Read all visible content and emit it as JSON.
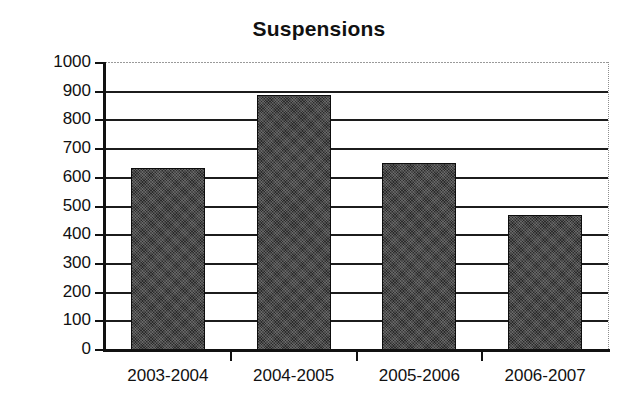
{
  "chart_data": {
    "type": "bar",
    "title": "Suspensions",
    "xlabel": "",
    "ylabel": "",
    "categories": [
      "2003-2004",
      "2004-2005",
      "2005-2006",
      "2006-2007"
    ],
    "values": [
      635,
      890,
      650,
      470
    ],
    "ylim": [
      0,
      1000
    ],
    "ytick_labels": [
      "1000",
      "900",
      "800",
      "700",
      "600",
      "500",
      "400",
      "300",
      "200",
      "100",
      "0"
    ],
    "ytick_values": [
      1000,
      900,
      800,
      700,
      600,
      500,
      400,
      300,
      200,
      100,
      0
    ],
    "grid": true,
    "legend": false,
    "bar_color": "#2b2b2b",
    "bar_edge_color": "#0d0d0d",
    "axis_color": "#111111",
    "background_color": "#ffffff"
  }
}
